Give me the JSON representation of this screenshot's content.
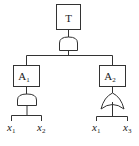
{
  "diagram": {
    "type": "fault-tree",
    "top_event": {
      "label": "T",
      "gate": "AND"
    },
    "intermediate_events": [
      {
        "label": "A",
        "subscript": "1",
        "gate": "AND",
        "inputs": [
          {
            "label": "x",
            "subscript": "1"
          },
          {
            "label": "x",
            "subscript": "2"
          }
        ]
      },
      {
        "label": "A",
        "subscript": "2",
        "gate": "OR",
        "inputs": [
          {
            "label": "x",
            "subscript": "1"
          },
          {
            "label": "x",
            "subscript": "3"
          }
        ]
      }
    ],
    "colors": {
      "stroke": "#333333",
      "background": "#ffffff"
    }
  }
}
